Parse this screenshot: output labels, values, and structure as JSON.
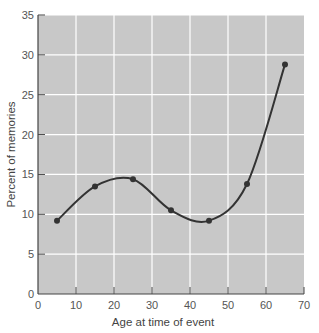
{
  "chart_data": {
    "type": "line",
    "title": "",
    "xlabel": "Age at time of event",
    "ylabel": "Percent of memories",
    "x": [
      5,
      15,
      25,
      35,
      45,
      55,
      65
    ],
    "series": [
      {
        "name": "Percent of memories",
        "values": [
          9.2,
          13.5,
          14.4,
          10.5,
          9.2,
          13.8,
          28.8
        ]
      }
    ],
    "xlim": [
      0,
      70
    ],
    "ylim": [
      0,
      35
    ],
    "xticks": [
      0,
      10,
      20,
      30,
      40,
      50,
      60,
      70
    ],
    "yticks": [
      0,
      5,
      10,
      15,
      20,
      25,
      30,
      35
    ],
    "grid": true,
    "legend": "none",
    "smooth": true,
    "markers": true
  },
  "colors": {
    "plot_background": "#c8c8c8",
    "gridline": "#ffffff",
    "line": "#333333",
    "marker": "#333333",
    "axis": "#444444"
  }
}
